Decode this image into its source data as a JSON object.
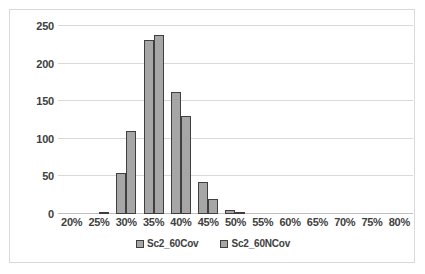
{
  "chart_data": {
    "type": "bar",
    "title": "",
    "subtitle": "",
    "xlabel": "",
    "ylabel": "",
    "categories": [
      "20%",
      "25%",
      "30%",
      "35%",
      "40%",
      "45%",
      "50%",
      "55%",
      "60%",
      "65%",
      "70%",
      "75%",
      "80%"
    ],
    "series": [
      {
        "name": "Sc2_60Cov",
        "values": [
          0,
          0,
          54,
          231,
          162,
          43,
          6,
          0,
          0,
          0,
          0,
          0,
          0
        ]
      },
      {
        "name": "Sc2_60NCov",
        "values": [
          0,
          3,
          110,
          238,
          131,
          20,
          1,
          0,
          0,
          0,
          0,
          0,
          0
        ]
      }
    ],
    "ylim": [
      0,
      250
    ],
    "yticks": [
      0,
      50,
      100,
      150,
      200,
      250
    ],
    "ytick_labels": [
      "0",
      "50",
      "100",
      "150",
      "200",
      "250"
    ],
    "grid": true,
    "legend_position": "bottom",
    "colors": {
      "bar_fill": "#a6a6a6",
      "bar_border": "#3f3f3f",
      "gridline": "#d9d9d9",
      "axis_text": "#404040",
      "frame_border": "#d9d9d9",
      "background": "#ffffff"
    }
  }
}
